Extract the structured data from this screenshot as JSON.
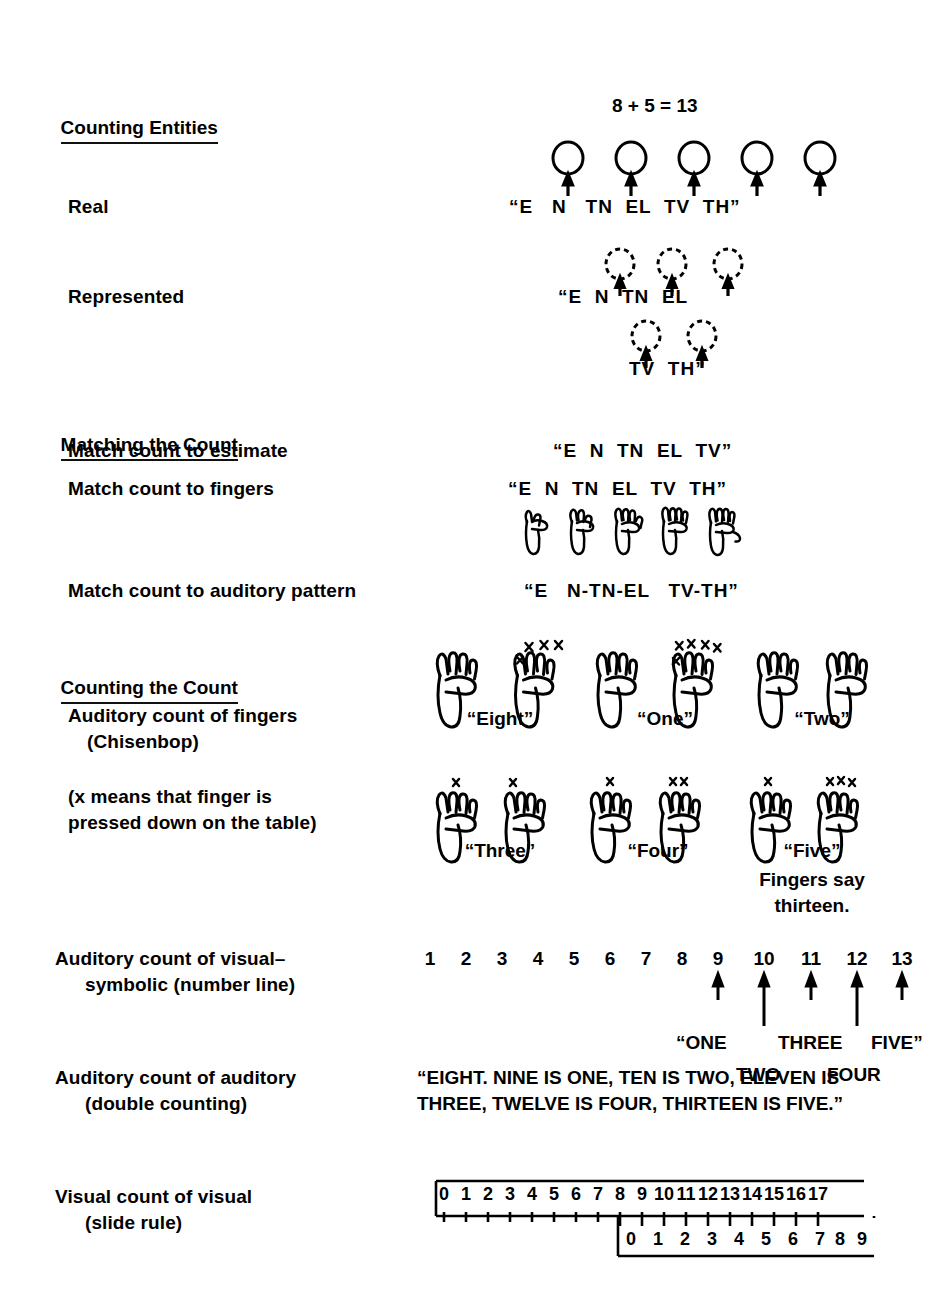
{
  "figure": {
    "equation_title": "8 + 5 = 13"
  },
  "sections": [
    {
      "id": "counting-entities",
      "heading": "Counting Entities",
      "rows": [
        {
          "id": "real",
          "label": "Real",
          "utterance": "“E   N   TN  EL  TV  TH”",
          "entities": 5,
          "entity_style": "solid-circle"
        },
        {
          "id": "represented",
          "label": "Represented",
          "utterance_line1": "“E  N  TN  EL",
          "utterance_line2": "TV  TH”",
          "entities_line1": 3,
          "entities_line2": 2,
          "entity_style": "dashed-circle"
        }
      ]
    },
    {
      "id": "matching-the-count",
      "heading": "Matching the Count",
      "rows": [
        {
          "id": "match-estimate",
          "label": "Match count to estimate",
          "value": "“E  N  TN  EL  TV”"
        },
        {
          "id": "match-fingers",
          "label": "Match count to fingers",
          "value": "“E  N  TN  EL  TV  TH”",
          "hands": [
            1,
            2,
            3,
            4,
            5
          ]
        },
        {
          "id": "match-auditory",
          "label": "Match count to auditory pattern",
          "value": "“E   N-TN-EL   TV-TH”"
        }
      ]
    },
    {
      "id": "counting-the-count",
      "heading": "Counting the Count",
      "rows": [
        {
          "id": "auditory-count-of-fingers",
          "label_line1": "Auditory count of fingers",
          "label_line2": "(Chisenbop)",
          "note_line1": "(x means that finger is",
          "note_line2": "pressed down on the table)",
          "chisenbop_row1": [
            {
              "caption": "“Eight”",
              "left_x": 0,
              "right_x": 3
            },
            {
              "caption": "“One”",
              "left_x": 0,
              "right_x": 4
            },
            {
              "caption": "“Two”",
              "left_x": 0,
              "right_x": 0
            }
          ],
          "chisenbop_row2": [
            {
              "caption": "“Three”",
              "left_x": 1,
              "right_x": 1
            },
            {
              "caption": "“Four”",
              "left_x": 1,
              "right_x": 2
            },
            {
              "caption": "“Five”",
              "left_x": 1,
              "right_x": 3
            }
          ],
          "footnote_line1": "Fingers say",
          "footnote_line2": "thirteen."
        },
        {
          "id": "auditory-count-visual-symbolic",
          "label_line1": "Auditory count of visual–",
          "label_line2": "symbolic (number line)",
          "numbers": [
            "1",
            "2",
            "3",
            "4",
            "5",
            "6",
            "7",
            "8",
            "9",
            "10",
            "11",
            "12",
            "13"
          ],
          "arrow_numbers": [
            "9",
            "10",
            "11",
            "12",
            "13"
          ],
          "words_line1": "“ONE",
          "words_line1b": "THREE",
          "words_line1c": "FIVE”",
          "words_line2a": "TWO",
          "words_line2b": "FOUR"
        },
        {
          "id": "auditory-count-of-auditory",
          "label_line1": "Auditory count of auditory",
          "label_line2": "(double counting)",
          "value_line1": "“EIGHT. NINE IS ONE, TEN IS TWO, ELEVEN IS",
          "value_line2": "THREE, TWELVE IS FOUR, THIRTEEN IS FIVE.”"
        },
        {
          "id": "visual-count-of-visual",
          "label_line1": "Visual count of visual",
          "label_line2": "(slide rule)",
          "top_scale": [
            "0",
            "1",
            "2",
            "3",
            "4",
            "5",
            "6",
            "7",
            "8",
            "9",
            "10",
            "11",
            "12",
            "13",
            "14",
            "15",
            "16",
            "17"
          ],
          "bottom_scale": [
            "0",
            "1",
            "2",
            "3",
            "4",
            "5",
            "6",
            "7",
            "8",
            "9"
          ],
          "bottom_offset": 8
        }
      ]
    }
  ],
  "colors": {
    "ink": "#000000",
    "paper": "#ffffff"
  }
}
